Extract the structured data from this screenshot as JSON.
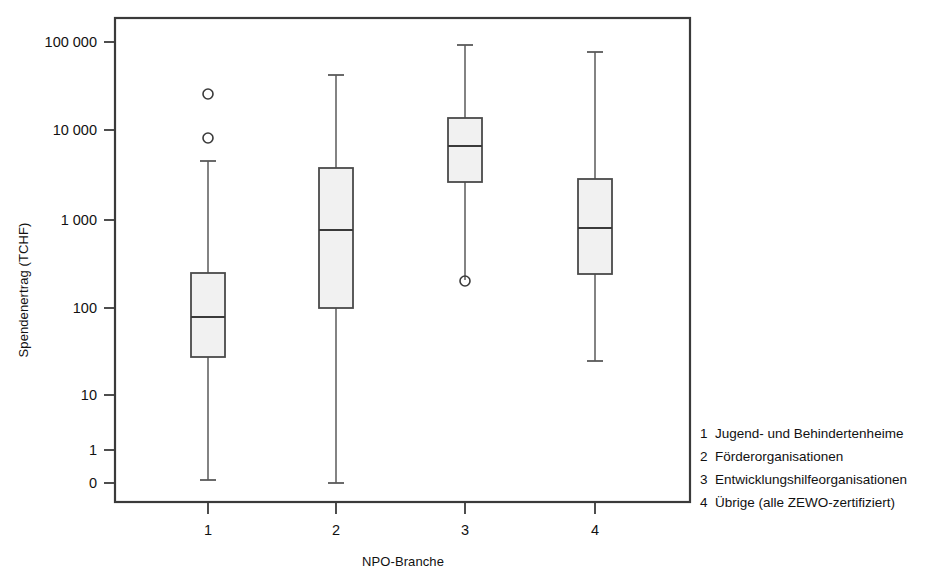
{
  "chart_data": {
    "type": "box",
    "title": "",
    "xlabel": "NPO-Branche",
    "ylabel": "Spendenertrag (TCHF)",
    "yscale": "log",
    "ytick_labels": [
      "100 000",
      "10 000",
      "1 000",
      "100",
      "10",
      "1",
      "0"
    ],
    "ytick_values": [
      100000,
      10000,
      1000,
      100,
      10,
      1,
      0
    ],
    "ytick_pixel_y": [
      42,
      130,
      220,
      308,
      395,
      450,
      483
    ],
    "xtick_labels": [
      "1",
      "2",
      "3",
      "4"
    ],
    "xtick_pixel_x": [
      208,
      336,
      465,
      595
    ],
    "grid": false,
    "legend_position": "right-bottom-outside",
    "boxes": [
      {
        "category": "1",
        "label": "Jugend- und Behindertenheime",
        "whisker_low": 0.5,
        "q1": 23,
        "median": 70,
        "q3": 215,
        "whisker_high": 4000,
        "outliers": [
          8000,
          25000
        ],
        "px": {
          "center": 208,
          "half_width": 17,
          "whisker_low_y": 480,
          "q1_y": 357,
          "median_y": 317,
          "q3_y": 273,
          "whisker_high_y": 161,
          "outlier_y": [
            138,
            94
          ]
        }
      },
      {
        "category": "2",
        "label": "Förderorganisationen",
        "whisker_low": 0.4,
        "q1": 88,
        "median": 680,
        "q3": 3400,
        "whisker_high": 31000,
        "outliers": [],
        "px": {
          "center": 336,
          "half_width": 17,
          "whisker_low_y": 483,
          "q1_y": 308,
          "median_y": 230,
          "q3_y": 168,
          "whisker_high_y": 75,
          "outlier_y": []
        }
      },
      {
        "category": "3",
        "label": "Entwicklungshilfeorganisationen",
        "whisker_low": 190,
        "q1": 2600,
        "median": 6300,
        "q3": 14000,
        "whisker_high": 66000,
        "outliers": [
          190
        ],
        "px": {
          "center": 465,
          "half_width": 17,
          "whisker_low_y": 280,
          "q1_y": 182,
          "median_y": 146,
          "q3_y": 118,
          "whisker_high_y": 45,
          "outlier_y": [
            281
          ]
        }
      },
      {
        "category": "4",
        "label": "Übrige (alle ZEWO-zertifiziert)",
        "whisker_low": 18,
        "q1": 235,
        "median": 760,
        "q3": 2700,
        "whisker_high": 58000,
        "outliers": [],
        "px": {
          "center": 595,
          "half_width": 17,
          "whisker_low_y": 361,
          "q1_y": 274,
          "median_y": 228,
          "q3_y": 179,
          "whisker_high_y": 52,
          "outlier_y": []
        }
      }
    ],
    "legend_entries": [
      {
        "key": "1",
        "text": "Jugend- und Behindertenheime"
      },
      {
        "key": "2",
        "text": "Förderorganisationen"
      },
      {
        "key": "3",
        "text": "Entwicklungshilfeorganisationen"
      },
      {
        "key": "4",
        "text": "Übrige (alle ZEWO-zertifiziert)"
      }
    ],
    "colors": {
      "box_fill": "#f1f1f1",
      "box_stroke": "#4a4a4a",
      "axis": "#3a3a3a",
      "text": "#111111",
      "background": "#ffffff"
    },
    "plot_area_px": {
      "left": 115,
      "right": 690,
      "top": 18,
      "bottom": 502
    }
  }
}
